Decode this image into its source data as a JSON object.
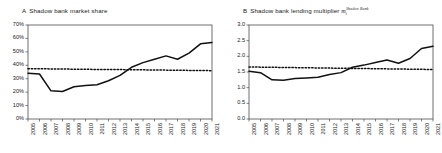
{
  "figure": {
    "panels": [
      {
        "tag": "A",
        "title": "Shadow bank market share",
        "has_math": false
      },
      {
        "tag": "B",
        "title": "Shadow bank lending multiplier",
        "has_math": true,
        "math": {
          "base": "m",
          "subscript": "t",
          "superscript": "Shadow Bank"
        }
      }
    ]
  },
  "chart_data": [
    {
      "type": "line",
      "title": "A Shadow bank market share",
      "xlabel": "",
      "ylabel": "",
      "grid": false,
      "legend": "none",
      "ylim": [
        0,
        70
      ],
      "ytick_labels": [
        "0%",
        "10%",
        "20%",
        "30%",
        "40%",
        "50%",
        "60%",
        "70%"
      ],
      "ytick_values": [
        0,
        10,
        20,
        30,
        40,
        50,
        60,
        70
      ],
      "categories": [
        "2005",
        "2006",
        "2007",
        "2008",
        "2009",
        "2010",
        "2011",
        "2012",
        "2013",
        "2014",
        "2015",
        "2016",
        "2017",
        "2018",
        "2019",
        "2020",
        "2021"
      ],
      "series": [
        {
          "name": "Shadow bank market share",
          "style": "solid",
          "values": [
            34,
            33.5,
            21,
            20.5,
            24,
            25,
            25.5,
            28.5,
            32.5,
            38.5,
            42,
            44.5,
            47,
            44.5,
            49,
            56,
            57
          ]
        },
        {
          "name": "Average reference level",
          "style": "dotted",
          "values": [
            37.5,
            37.4,
            37.3,
            37.2,
            37.1,
            37.0,
            36.9,
            36.9,
            36.8,
            36.7,
            36.6,
            36.5,
            36.4,
            36.3,
            36.2,
            36.1,
            36.0
          ]
        }
      ]
    },
    {
      "type": "line",
      "title": "B Shadow bank lending multiplier",
      "xlabel": "",
      "ylabel": "",
      "grid": false,
      "legend": "none",
      "ylim": [
        0,
        3
      ],
      "ytick_labels": [
        "0.0",
        "0.5",
        "1.0",
        "1.5",
        "2.0",
        "2.5",
        "3.0"
      ],
      "ytick_values": [
        0,
        0.5,
        1.0,
        1.5,
        2.0,
        2.5,
        3.0
      ],
      "categories": [
        "2005",
        "2006",
        "2007",
        "2008",
        "2009",
        "2010",
        "2011",
        "2012",
        "2013",
        "2014",
        "2015",
        "2016",
        "2017",
        "2018",
        "2019",
        "2020",
        "2021"
      ],
      "series": [
        {
          "name": "Shadow bank lending multiplier",
          "style": "solid",
          "values": [
            1.52,
            1.48,
            1.25,
            1.24,
            1.29,
            1.31,
            1.33,
            1.42,
            1.48,
            1.65,
            1.72,
            1.8,
            1.88,
            1.78,
            1.93,
            2.25,
            2.32
          ]
        },
        {
          "name": "Average reference level",
          "style": "dotted",
          "values": [
            1.66,
            1.655,
            1.65,
            1.645,
            1.64,
            1.635,
            1.63,
            1.625,
            1.62,
            1.615,
            1.61,
            1.605,
            1.6,
            1.595,
            1.59,
            1.585,
            1.58
          ]
        }
      ]
    }
  ]
}
